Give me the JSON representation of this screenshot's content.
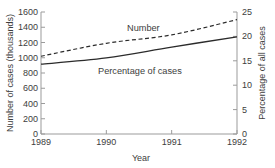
{
  "chart_data": {
    "type": "line",
    "title": "",
    "x": [
      1989,
      1990,
      1991,
      1992
    ],
    "x_tick_labels": [
      "1989",
      "1990",
      "1991",
      "1992"
    ],
    "xlabel": "Year",
    "series": [
      {
        "name": "Number",
        "axis": "left",
        "style": "dashed",
        "values": [
          1020,
          1190,
          1300,
          1500
        ]
      },
      {
        "name": "Percentage of cases",
        "axis": "right",
        "style": "solid",
        "values": [
          14.3,
          15.6,
          17.8,
          19.9
        ]
      }
    ],
    "left_axis": {
      "label": "Number of cases (thousands)",
      "min": 0,
      "max": 1600,
      "ticks": [
        0,
        200,
        400,
        600,
        800,
        1000,
        1200,
        1400,
        1600
      ]
    },
    "right_axis": {
      "label": "Percentage of all cases",
      "min": 0,
      "max": 25,
      "ticks": [
        0,
        5,
        10,
        15,
        20,
        25
      ]
    },
    "grid": false,
    "legend_position": "inline-labels",
    "colors": {
      "line": "#2b2b2b",
      "axis": "#9b9b9b",
      "text": "#3d3d3d",
      "background": "#ffffff"
    }
  }
}
